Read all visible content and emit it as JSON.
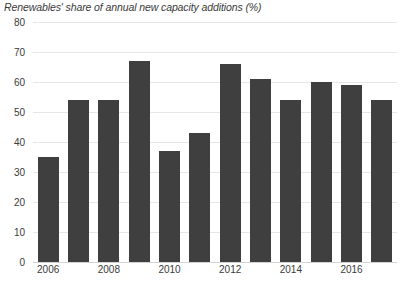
{
  "chart_data": {
    "type": "bar",
    "title": "Renewables' share of annual new capacity additions (%)",
    "subtitle": "",
    "xlabel": "",
    "ylabel": "",
    "ylim": [
      0,
      80
    ],
    "y_ticks": [
      0,
      10,
      20,
      30,
      40,
      50,
      60,
      70,
      80
    ],
    "grid": true,
    "legend": false,
    "legend_position": "none",
    "categories": [
      "2006",
      "2007",
      "2008",
      "2009",
      "2010",
      "2011",
      "2012",
      "2013",
      "2014",
      "2015",
      "2016",
      "2017"
    ],
    "x_tick_labels": [
      "2006",
      "2008",
      "2010",
      "2012",
      "2014",
      "2016"
    ],
    "values": [
      35,
      54,
      54,
      67,
      37,
      43,
      66,
      61,
      54,
      60,
      59,
      54
    ],
    "bar_color": "#3f3f3f",
    "gridline_color": "#e6e6e6",
    "background_color": "#ffffff",
    "text_color": "#3a3a3a"
  }
}
